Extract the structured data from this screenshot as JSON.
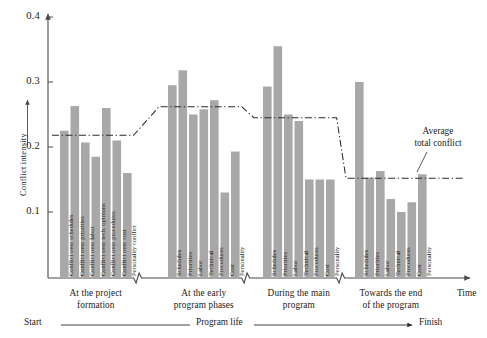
{
  "chart_data": {
    "type": "bar",
    "title": "",
    "xlabel": "Time",
    "ylabel": "Conflict intensity",
    "ylim": [
      0.065,
      0.4
    ],
    "yticks": [
      0.1,
      0.2,
      0.3,
      0.4
    ],
    "ytick_labels": [
      "0.1",
      "0.2",
      "0.3",
      "0.4"
    ],
    "grid": false,
    "legend_position": "none",
    "groups": [
      {
        "caption_line1": "At the project",
        "caption_line2": "formation",
        "categories": [
          "Conflict over schedules",
          "Conflict over priorities",
          "Conflict over labor",
          "Conflict over tech. opinions",
          "Conflict over procedures",
          "Conflict over cost",
          "Personality conflict"
        ],
        "values": [
          0.225,
          0.263,
          0.207,
          0.185,
          0.26,
          0.21,
          0.16
        ],
        "average": 0.218
      },
      {
        "caption_line1": "At the early",
        "caption_line2": "program phases",
        "categories": [
          "Schedules",
          "Priorities",
          "Labor",
          "Technical",
          "Procedures",
          "Cost",
          "Personality"
        ],
        "values": [
          0.295,
          0.318,
          0.25,
          0.258,
          0.272,
          0.13,
          0.193
        ],
        "average": 0.262
      },
      {
        "caption_line1": "During the main",
        "caption_line2": "program",
        "categories": [
          "Schedules",
          "Priorities",
          "Labor",
          "Technical",
          "Procedures",
          "Cost",
          "Personality"
        ],
        "values": [
          0.293,
          0.355,
          0.25,
          0.24,
          0.15,
          0.15,
          0.15
        ],
        "average": 0.245
      },
      {
        "caption_line1": "Towards the end",
        "caption_line2": "of the program",
        "categories": [
          "Schedules",
          "Priorities",
          "Labor",
          "Technical",
          "Procedures",
          "Cost",
          "Personality"
        ],
        "values": [
          0.3,
          0.153,
          0.163,
          0.12,
          0.1,
          0.115,
          0.158
        ],
        "average": 0.152
      }
    ],
    "annotation": {
      "line1": "Average",
      "line2": "total conflict"
    },
    "timeline": {
      "start": "Start",
      "middle": "Program life",
      "finish": "Finish"
    },
    "colors": {
      "bar": "#a8a8a8",
      "axis": "#4a4a4a",
      "average_line": "#2b2b2b",
      "text": "#1a1a1a",
      "background": "#ffffff"
    }
  }
}
